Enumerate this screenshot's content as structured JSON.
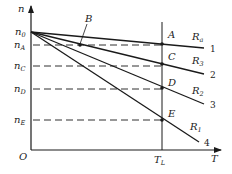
{
  "diagram": {
    "type": "mechanical characteristic curves (speed vs torque) of a motor with armature resistance",
    "axes": {
      "y_label": "n",
      "x_label": "T",
      "origin_label": "O"
    },
    "y_ticks": [
      {
        "label": "n",
        "sub": "0",
        "y": 32
      },
      {
        "label": "n",
        "sub": "A",
        "y": 45
      },
      {
        "label": "n",
        "sub": "C",
        "y": 66
      },
      {
        "label": "n",
        "sub": "D",
        "y": 89
      },
      {
        "label": "n",
        "sub": "E",
        "y": 120
      }
    ],
    "x_ticks": [
      {
        "label": "T",
        "sub": "L",
        "x": 162
      }
    ],
    "lines": [
      {
        "number": "1",
        "resistance_label": "R",
        "resistance_sub": "a",
        "end": [
          204,
          48
        ]
      },
      {
        "number": "2",
        "resistance_label": "R",
        "resistance_sub": "3",
        "end": [
          204,
          74
        ]
      },
      {
        "number": "3",
        "resistance_label": "R",
        "resistance_sub": "2",
        "end": [
          204,
          104
        ]
      },
      {
        "number": "4",
        "resistance_label": "R",
        "resistance_sub": "1",
        "end": [
          199,
          142
        ]
      }
    ],
    "points": [
      {
        "label": "A",
        "x": 162,
        "y": 44
      },
      {
        "label": "B",
        "x": 80,
        "y": 45
      },
      {
        "label": "C",
        "x": 162,
        "y": 64
      },
      {
        "label": "D",
        "x": 162,
        "y": 88
      },
      {
        "label": "E",
        "x": 162,
        "y": 120
      }
    ],
    "colors": {
      "line": "#1a1a1a",
      "background": "#ffffff"
    }
  }
}
